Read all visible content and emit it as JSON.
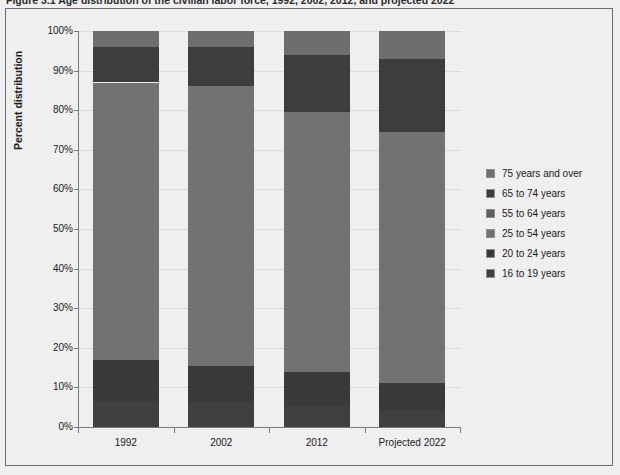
{
  "figure": {
    "caption": "Figure 3.1  Age distribution of the civilian labor force, 1992, 2002, 2012, and projected 2022"
  },
  "axes": {
    "y_title": "Percent distribution",
    "y_ticks": [
      "100%",
      "90%",
      "80%",
      "70%",
      "60%",
      "50%",
      "40%",
      "30%",
      "20%",
      "10%",
      "0%"
    ],
    "x_ticks": [
      "1992",
      "2002",
      "2012",
      "Projected 2022"
    ]
  },
  "legend": {
    "items": [
      {
        "label": "75 years and over",
        "color": "#6e6e6e"
      },
      {
        "label": "65 to 74 years",
        "color": "#3d3d3d"
      },
      {
        "label": "55 to 64 years",
        "color": "#5f5f5f"
      },
      {
        "label": "25 to 54 years",
        "color": "#727272"
      },
      {
        "label": "20 to 24 years",
        "color": "#3a3a3a"
      },
      {
        "label": "16 to 19 years",
        "color": "#404040"
      }
    ]
  },
  "chart_data": {
    "type": "bar",
    "stacked": true,
    "title": "Age distribution of the civilian labor force, 1992, 2002, 2012, and projected 2022",
    "xlabel": "",
    "ylabel": "Percent distribution",
    "ylim": [
      0,
      100
    ],
    "ytick_values": [
      0,
      10,
      20,
      30,
      40,
      50,
      60,
      70,
      80,
      90,
      100
    ],
    "grid": true,
    "legend_position": "right",
    "categories": [
      "1992",
      "2002",
      "2012",
      "Projected 2022"
    ],
    "series": [
      {
        "name": "16 to 19 years",
        "color": "#404040",
        "values": [
          6.5,
          6.0,
          5.0,
          4.0
        ]
      },
      {
        "name": "20 to 24 years",
        "color": "#3a3a3a",
        "values": [
          10.5,
          9.5,
          9.0,
          7.0
        ]
      },
      {
        "name": "25 to 54 years",
        "color": "#727272",
        "values": [
          70.0,
          70.5,
          65.5,
          63.5
        ]
      },
      {
        "name": "55 to 64 years",
        "color": "#5f5f5f",
        "values": [
          0.0,
          0.0,
          0.0,
          0.0
        ]
      },
      {
        "name": "65 to 74 years",
        "color": "#3d3d3d",
        "values": [
          9.0,
          10.0,
          14.5,
          18.5
        ]
      },
      {
        "name": "75 years and over",
        "color": "#6e6e6e",
        "values": [
          4.0,
          4.0,
          6.0,
          7.0
        ]
      }
    ]
  }
}
